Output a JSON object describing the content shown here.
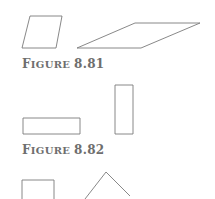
{
  "figures": [
    {
      "caption_word_initial": "F",
      "caption_word_rest": "IGURE",
      "caption_number": "8.81",
      "shapes": [
        {
          "type": "parallelogram",
          "points": "30,16 62,16 56,48 22,48"
        },
        {
          "type": "parallelogram",
          "points": "135,23 200,23 141,48 77,48"
        }
      ]
    },
    {
      "caption_word_initial": "F",
      "caption_word_rest": "IGURE",
      "caption_number": "8.82",
      "shapes": [
        {
          "type": "rectangle",
          "points": "23,118 80,118 80,134 23,134"
        },
        {
          "type": "rectangle",
          "points": "115,85 133,85 133,134 115,134"
        }
      ]
    },
    {
      "shapes": [
        {
          "type": "square",
          "points": "22,200 22,180 54,180 54,200"
        },
        {
          "type": "diamond",
          "points": "85,199 106,172 130,196"
        }
      ]
    }
  ],
  "colors": {
    "stroke": "#7a7a7a",
    "caption": "#6e6e6e"
  }
}
